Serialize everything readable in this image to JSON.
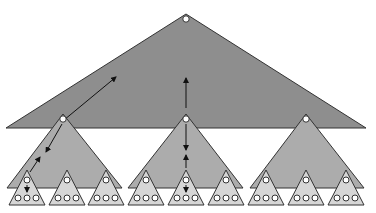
{
  "diagram": {
    "colors": {
      "background": "#ffffff",
      "level0_fill": "#8e8e8e",
      "level1_fill": "#acacac",
      "level2_fill": "#d6d6d6",
      "outline": "#333333",
      "node_fill": "#ffffff",
      "arrow": "#111111"
    },
    "levels": [
      {
        "name": "root",
        "count": 1
      },
      {
        "name": "middle",
        "count": 3
      },
      {
        "name": "leaf",
        "count": 9,
        "nodes_per_triangle": 4
      }
    ],
    "arrows": [
      {
        "from": "middle-1-root",
        "to": "root-region",
        "direction": "up-right"
      },
      {
        "from": "middle-2-root",
        "to": "root-region",
        "direction": "up"
      },
      {
        "from": "middle-1-root",
        "to": "middle-1-region",
        "direction": "down-left"
      },
      {
        "from": "leaf-1-root",
        "to": "middle-1-region",
        "direction": "up-right"
      },
      {
        "from": "middle-2-root",
        "to": "middle-2-region",
        "direction": "down"
      },
      {
        "from": "leaf-5-root",
        "to": "middle-2-region",
        "direction": "up"
      },
      {
        "from": "leaf-1-root",
        "to": "leaf-1-region",
        "direction": "down"
      },
      {
        "from": "leaf-5-root",
        "to": "leaf-5-region",
        "direction": "down"
      }
    ]
  }
}
